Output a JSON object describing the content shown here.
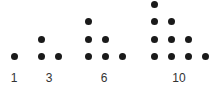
{
  "diagram": {
    "dot_color": "#1a1a1a",
    "groups": [
      {
        "label": "1",
        "rows": 1,
        "label_x": 14
      },
      {
        "label": "3",
        "rows": 2,
        "label_x": 49
      },
      {
        "label": "6",
        "rows": 3,
        "label_x": 104
      },
      {
        "label": "10",
        "rows": 4,
        "label_x": 179
      }
    ]
  }
}
